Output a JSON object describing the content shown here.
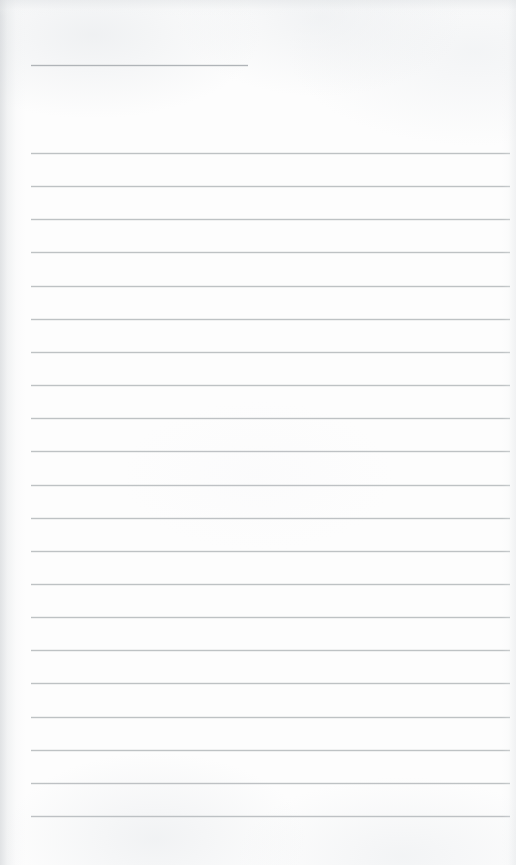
{
  "page": {
    "kind": "scanned-ruled-notebook-page",
    "width": 516,
    "height": 865,
    "background_color": "#fdfdfd",
    "rule_color": "#b9bdc1",
    "header_rule_color": "#a9adb2",
    "edge_shadow_color": "#c4c8cc",
    "text_content": "",
    "visible_text_count": 0
  },
  "header_rule": {
    "name": "short-header-rule",
    "x": 31,
    "y": 65,
    "width": 217,
    "thickness": 1
  },
  "body_rules": {
    "name": "full-width-rule-set",
    "count": 21,
    "x": 31,
    "width": 479,
    "first_y": 153,
    "spacing": 33.1,
    "thickness": 1,
    "y_positions": [
      153,
      186,
      219,
      252,
      286,
      319,
      352,
      385,
      418,
      451,
      485,
      518,
      551,
      584,
      617,
      650,
      683,
      717,
      750,
      783,
      816
    ]
  }
}
